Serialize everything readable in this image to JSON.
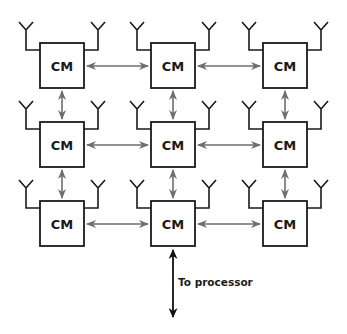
{
  "diagram": {
    "node_label": "CM",
    "nodes": [
      {
        "id": "r1c1",
        "label": "CM"
      },
      {
        "id": "r1c2",
        "label": "CM"
      },
      {
        "id": "r1c3",
        "label": "CM"
      },
      {
        "id": "r2c1",
        "label": "CM"
      },
      {
        "id": "r2c2",
        "label": "CM"
      },
      {
        "id": "r2c3",
        "label": "CM"
      },
      {
        "id": "r3c1",
        "label": "CM"
      },
      {
        "id": "r3c2",
        "label": "CM"
      },
      {
        "id": "r3c3",
        "label": "CM"
      }
    ],
    "processor_link_label": "To processor",
    "colors": {
      "box_stroke": "#1a1a1a",
      "mesh_arrow": "#6e6e6e",
      "processor_arrow": "#111111"
    }
  }
}
